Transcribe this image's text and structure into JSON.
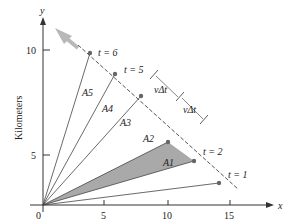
{
  "diagram": {
    "x_axis": {
      "label": "x",
      "title": "Kilometers",
      "ticks": [
        "0",
        "5",
        "10",
        "15"
      ]
    },
    "y_axis": {
      "label": "y",
      "title": "Kilometers",
      "ticks": [
        "5",
        "10"
      ]
    },
    "time_labels": [
      "t = 1",
      "t = 2",
      "t = 5",
      "t = 6"
    ],
    "areas": [
      "A1",
      "A2",
      "A3",
      "A4",
      "A5"
    ],
    "interval_labels": [
      "vΔt",
      "vΔt"
    ],
    "shaded_area": "A2",
    "colors": {
      "shade": "#a9a9a9",
      "arrow": "#b8b8b8",
      "point": "#666666"
    }
  }
}
